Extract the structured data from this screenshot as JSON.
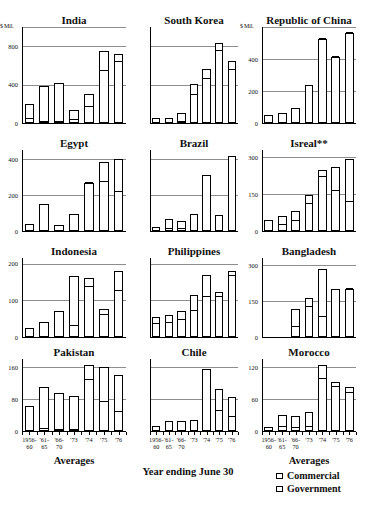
{
  "figure": {
    "unit_label": "$ Mil.",
    "x_axis_caption": "Averages",
    "footnote": "Year ending June 30",
    "categories": [
      "1956-60",
      "'61-65",
      "'66-70",
      "'73",
      "'74",
      "'75",
      "'76"
    ],
    "category_line1": [
      "1956-",
      "'61-",
      "'66-",
      "'73",
      "'74",
      "'75",
      "'76"
    ],
    "category_line2": [
      "60",
      "65",
      "70",
      "",
      "",
      "",
      ""
    ]
  },
  "legend": {
    "position": "bottom-right",
    "items": [
      {
        "label": "Commercial",
        "swatch": "open-square"
      },
      {
        "label": "Government",
        "swatch": "dotted-square"
      }
    ]
  },
  "chart_data": [
    {
      "type": "bar",
      "title": "India",
      "xlabel": "Averages",
      "ylabel": "$ Mil.",
      "ylim": [
        0,
        1000
      ],
      "yticks": [
        0,
        400,
        800
      ],
      "ytick_labels": [
        "0",
        "400",
        "800"
      ],
      "grid": true,
      "categories": [
        "1956-60",
        "'61-65",
        "'66-70",
        "'73",
        "'74",
        "'75",
        "'76"
      ],
      "series": [
        {
          "name": "Commercial",
          "values": [
            160,
            380,
            410,
            105,
            135,
            200,
            75
          ]
        },
        {
          "name": "Government",
          "values": [
            40,
            10,
            10,
            35,
            165,
            545,
            640
          ]
        }
      ],
      "totals": [
        200,
        390,
        420,
        140,
        300,
        745,
        715
      ]
    },
    {
      "type": "bar",
      "title": "South Korea",
      "xlabel": "Averages",
      "ylabel": "",
      "ylim": [
        0,
        1000
      ],
      "yticks": [
        0,
        400,
        800
      ],
      "ytick_labels": [
        "",
        "",
        ""
      ],
      "grid": true,
      "categories": [
        "1956-60",
        "'61-65",
        "'66-70",
        "'73",
        "'74",
        "'75",
        "'76"
      ],
      "series": [
        {
          "name": "Commercial",
          "values": [
            55,
            50,
            90,
            120,
            105,
            85,
            95
          ]
        },
        {
          "name": "Government",
          "values": [
            0,
            0,
            10,
            290,
            455,
            750,
            555
          ]
        }
      ],
      "totals": [
        55,
        50,
        100,
        410,
        560,
        835,
        650
      ]
    },
    {
      "type": "bar",
      "title": "Republic of China",
      "xlabel": "Averages",
      "ylabel": "$ Mil.",
      "ylim": [
        0,
        600
      ],
      "yticks": [
        0,
        200,
        400
      ],
      "ytick_labels": [
        "0",
        "200",
        "400"
      ],
      "grid": true,
      "categories": [
        "1956-60",
        "'61-65",
        "'66-70",
        "'73",
        "'74",
        "'75",
        "'76"
      ],
      "series": [
        {
          "name": "Commercial",
          "values": [
            50,
            65,
            95,
            240,
            0,
            0,
            0
          ]
        },
        {
          "name": "Government",
          "values": [
            0,
            0,
            0,
            0,
            525,
            410,
            560
          ]
        }
      ],
      "totals": [
        50,
        65,
        95,
        240,
        525,
        410,
        560
      ]
    },
    {
      "type": "bar",
      "title": "Egypt",
      "xlabel": "Averages",
      "ylabel": "",
      "ylim": [
        0,
        450
      ],
      "yticks": [
        0,
        200,
        400
      ],
      "ytick_labels": [
        "0",
        "200",
        "400"
      ],
      "grid": true,
      "categories": [
        "1956-60",
        "'61-65",
        "'66-70",
        "'73",
        "'74",
        "'75",
        "'76"
      ],
      "series": [
        {
          "name": "Commercial",
          "values": [
            40,
            150,
            35,
            95,
            0,
            115,
            185
          ]
        },
        {
          "name": "Government",
          "values": [
            0,
            0,
            0,
            0,
            265,
            270,
            215
          ]
        }
      ],
      "totals": [
        40,
        150,
        35,
        95,
        265,
        385,
        400
      ]
    },
    {
      "type": "bar",
      "title": "Brazil",
      "xlabel": "Averages",
      "ylabel": "",
      "ylim": [
        0,
        450
      ],
      "yticks": [
        0,
        200,
        400
      ],
      "ytick_labels": [
        "",
        "",
        ""
      ],
      "grid": true,
      "categories": [
        "1956-60",
        "'61-65",
        "'66-70",
        "'73",
        "'74",
        "'75",
        "'76"
      ],
      "series": [
        {
          "name": "Commercial",
          "values": [
            20,
            55,
            45,
            95,
            310,
            90,
            415
          ]
        },
        {
          "name": "Government",
          "values": [
            0,
            10,
            10,
            0,
            0,
            0,
            0
          ]
        }
      ],
      "totals": [
        20,
        65,
        55,
        95,
        310,
        90,
        415
      ]
    },
    {
      "type": "bar",
      "title": "Isreal**",
      "xlabel": "Averages",
      "ylabel": "",
      "ylim": [
        0,
        330
      ],
      "yticks": [
        0,
        150,
        300
      ],
      "ytick_labels": [
        "0",
        "150",
        "300"
      ],
      "grid": true,
      "categories": [
        "1956-60",
        "'61-65",
        "'66-70",
        "'73",
        "'74",
        "'75",
        "'76"
      ],
      "series": [
        {
          "name": "Commercial",
          "values": [
            45,
            35,
            40,
            35,
            30,
            95,
            175
          ]
        },
        {
          "name": "Government",
          "values": [
            0,
            25,
            40,
            110,
            220,
            165,
            120
          ]
        }
      ],
      "totals": [
        45,
        60,
        80,
        145,
        250,
        260,
        295
      ]
    },
    {
      "type": "bar",
      "title": "Indonesia",
      "xlabel": "Averages",
      "ylabel": "",
      "ylim": [
        0,
        215
      ],
      "yticks": [
        0,
        100,
        200
      ],
      "ytick_labels": [
        "0",
        "100",
        "200"
      ],
      "grid": true,
      "categories": [
        "1956-60",
        "'61-65",
        "'66-70",
        "'73",
        "'74",
        "'75",
        "'76"
      ],
      "series": [
        {
          "name": "Commercial",
          "values": [
            25,
            40,
            70,
            135,
            25,
            15,
            55
          ]
        },
        {
          "name": "Government",
          "values": [
            0,
            0,
            0,
            30,
            135,
            60,
            125
          ]
        }
      ],
      "totals": [
        25,
        40,
        70,
        165,
        160,
        75,
        180
      ]
    },
    {
      "type": "bar",
      "title": "Philippines",
      "xlabel": "Averages",
      "ylabel": "",
      "ylim": [
        0,
        215
      ],
      "yticks": [
        0,
        100,
        200
      ],
      "ytick_labels": [
        "",
        "",
        ""
      ],
      "grid": true,
      "categories": [
        "1956-60",
        "'61-65",
        "'66-70",
        "'73",
        "'74",
        "'75",
        "'76"
      ],
      "series": [
        {
          "name": "Commercial",
          "values": [
            20,
            22,
            25,
            45,
            60,
            12,
            15
          ]
        },
        {
          "name": "Government",
          "values": [
            35,
            38,
            45,
            70,
            110,
            110,
            165
          ]
        }
      ],
      "totals": [
        55,
        60,
        70,
        115,
        170,
        122,
        180
      ]
    },
    {
      "type": "bar",
      "title": "Bangladesh",
      "xlabel": "Averages",
      "ylabel": "",
      "ylim": [
        0,
        330
      ],
      "yticks": [
        0,
        150,
        300
      ],
      "ytick_labels": [
        "0",
        "150",
        "300"
      ],
      "grid": true,
      "categories": [
        "1956-60",
        "'61-65",
        "'66-70",
        "'73",
        "'74",
        "'75",
        "'76"
      ],
      "series": [
        {
          "name": "Commercial",
          "values": [
            0,
            0,
            75,
            40,
            200,
            200,
            0
          ]
        },
        {
          "name": "Government",
          "values": [
            0,
            0,
            40,
            125,
            85,
            0,
            200
          ]
        }
      ],
      "totals": [
        0,
        0,
        115,
        165,
        285,
        200,
        200
      ]
    },
    {
      "type": "bar",
      "title": "Pakistan",
      "xlabel": "Averages",
      "ylabel": "",
      "ylim": [
        0,
        180
      ],
      "yticks": [
        0,
        80,
        160
      ],
      "ytick_labels": [
        "0",
        "80",
        "160"
      ],
      "grid": true,
      "categories": [
        "1956-60",
        "'61-65",
        "'66-70",
        "'73",
        "'74",
        "'75",
        "'76"
      ],
      "series": [
        {
          "name": "Commercial",
          "values": [
            62,
            105,
            92,
            85,
            38,
            88,
            92
          ]
        },
        {
          "name": "Government",
          "values": [
            0,
            5,
            3,
            2,
            128,
            72,
            48
          ]
        }
      ],
      "totals": [
        62,
        110,
        95,
        87,
        166,
        160,
        140
      ]
    },
    {
      "type": "bar",
      "title": "Chile",
      "xlabel": "Averages",
      "ylabel": "",
      "ylim": [
        0,
        180
      ],
      "yticks": [
        0,
        80,
        160
      ],
      "ytick_labels": [
        "",
        "",
        ""
      ],
      "grid": true,
      "categories": [
        "1956-60",
        "'61-65",
        "'66-70",
        "'73",
        "'74",
        "'75",
        "'76"
      ],
      "series": [
        {
          "name": "Commercial",
          "values": [
            12,
            25,
            26,
            27,
            155,
            55,
            50
          ]
        },
        {
          "name": "Government",
          "values": [
            0,
            0,
            0,
            0,
            0,
            50,
            35
          ]
        }
      ],
      "totals": [
        12,
        25,
        26,
        27,
        155,
        105,
        85
      ]
    },
    {
      "type": "bar",
      "title": "Morocco",
      "xlabel": "Averages",
      "ylabel": "",
      "ylim": [
        0,
        135
      ],
      "yticks": [
        0,
        60,
        120
      ],
      "ytick_labels": [
        "0",
        "60",
        "120"
      ],
      "grid": true,
      "categories": [
        "1956-60",
        "'61-65",
        "'66-70",
        "'73",
        "'74",
        "'75",
        "'76"
      ],
      "series": [
        {
          "name": "Commercial",
          "values": [
            8,
            22,
            22,
            28,
            25,
            10,
            10
          ]
        },
        {
          "name": "Government",
          "values": [
            0,
            8,
            6,
            8,
            98,
            82,
            72
          ]
        }
      ],
      "totals": [
        8,
        30,
        28,
        36,
        123,
        92,
        82
      ]
    }
  ]
}
